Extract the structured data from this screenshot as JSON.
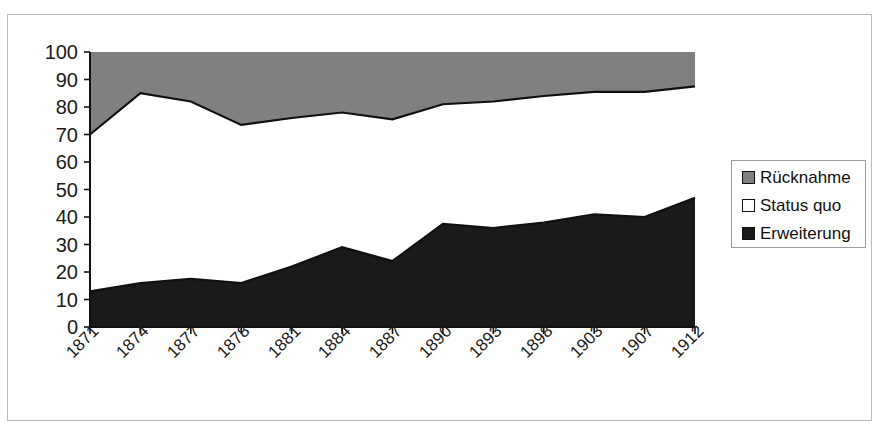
{
  "chart_data": {
    "type": "area",
    "stacked": true,
    "title": "",
    "xlabel": "",
    "ylabel": "",
    "categories": [
      "1871",
      "1874",
      "1877",
      "1878",
      "1881",
      "1884",
      "1887",
      "1890",
      "1893",
      "1898",
      "1903",
      "1907",
      "1912"
    ],
    "series": [
      {
        "name": "Erweiterung",
        "color": "#1a1a1a",
        "values": [
          13,
          16,
          17.5,
          16,
          22,
          29,
          24,
          37.5,
          36,
          38,
          41,
          40,
          47
        ]
      },
      {
        "name": "Status quo",
        "color": "#ffffff",
        "values": [
          57,
          69,
          64.5,
          57.5,
          54,
          49,
          51.5,
          43.5,
          46,
          46,
          44.5,
          45.5,
          40.5
        ]
      },
      {
        "name": "Rücknahme",
        "color": "#808080",
        "values": [
          30,
          15,
          18,
          26.5,
          24,
          22,
          24.5,
          19,
          18,
          16,
          14.5,
          14.5,
          12.5
        ]
      }
    ],
    "cumulative_upper_boundary": [
      70,
      85,
      82,
      73.5,
      76,
      78,
      75.5,
      81,
      82,
      84,
      85.5,
      85.5,
      87.5
    ],
    "ylim": [
      0,
      100
    ],
    "yticks": [
      0,
      10,
      20,
      30,
      40,
      50,
      60,
      70,
      80,
      90,
      100
    ],
    "ytick_labels": [
      "0",
      "10",
      "20",
      "30",
      "40",
      "50",
      "60",
      "70",
      "80",
      "90",
      "100"
    ],
    "grid": false,
    "legend_position": "right"
  },
  "legend": {
    "entries": [
      {
        "label": "Rücknahme",
        "swatch": "#808080"
      },
      {
        "label": "Status quo",
        "swatch": "#ffffff"
      },
      {
        "label": "Erweiterung",
        "swatch": "#1a1a1a"
      }
    ]
  },
  "colors": {
    "ruecknahme": "#808080",
    "status_quo": "#ffffff",
    "erweiterung": "#1a1a1a",
    "axis": "#101010",
    "frame": "#b9b9b9"
  }
}
